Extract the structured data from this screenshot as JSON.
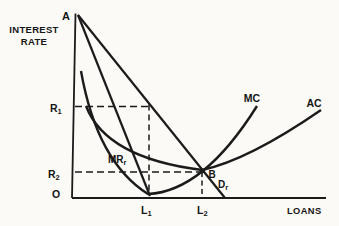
{
  "figure_type": "economics-curve-diagram",
  "axis": {
    "y_label_line1": "INTEREST",
    "y_label_line2": "RATE",
    "x_label": "LOANS",
    "origin": "O"
  },
  "labels": {
    "a": {
      "text": "A"
    },
    "b": {
      "text": "B"
    },
    "r1": {
      "main": "R",
      "sub": "1"
    },
    "r2": {
      "main": "R",
      "sub": "2"
    },
    "l1": {
      "main": "L",
      "sub": "1"
    },
    "l2": {
      "main": "L",
      "sub": "2"
    },
    "mc": {
      "text": "MC"
    },
    "ac": {
      "text": "AC"
    },
    "mr": {
      "main": "MR",
      "sub": "r"
    },
    "d": {
      "main": "D",
      "sub": "r"
    }
  },
  "curves": [
    {
      "id": "demand",
      "label": "Dr",
      "shape": "straight line from A through B to x-axis"
    },
    {
      "id": "marginal-revenue",
      "label": "MRr",
      "shape": "straight line from A to x-axis at L1"
    },
    {
      "id": "marginal-cost",
      "label": "MC",
      "shape": "U-curve, minimum near L1, rising through B"
    },
    {
      "id": "average-cost",
      "label": "AC",
      "shape": "U-curve, minimum at B above L2"
    }
  ],
  "guides": [
    {
      "id": "r1-l1",
      "x_label": "L1",
      "y_label": "R1"
    },
    {
      "id": "r2-l2",
      "x_label": "L2",
      "y_label": "R2"
    }
  ],
  "colors": {
    "ink": "#1b1b1b",
    "background": "#fbfaf7"
  }
}
